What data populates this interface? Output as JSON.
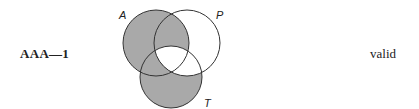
{
  "form": {
    "label": "AAA—1"
  },
  "verdict": {
    "label": "valid"
  },
  "diagram": {
    "terms": {
      "a": "A",
      "p": "P",
      "t": "T"
    },
    "shade_color": "#a9a9a9",
    "line_color": "#333333",
    "shaded_regions": [
      "A only",
      "A and P not T",
      "A and T not P",
      "T only"
    ],
    "unshaded_regions": [
      "A and P and T",
      "P only",
      "P and T not A"
    ]
  }
}
